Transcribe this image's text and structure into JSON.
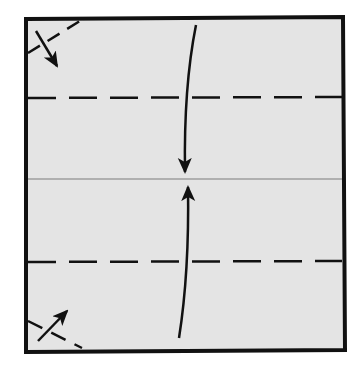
{
  "diagram": {
    "type": "origami-fold-instruction",
    "colors": {
      "background": "#ffffff",
      "paper": "#e4e4e4",
      "outline": "#111111",
      "crease": "#7a7a7a",
      "arrow": "#111111"
    },
    "paper": {
      "x1": 26,
      "y1": 19,
      "x2": 343,
      "y2": 350
    },
    "valley_folds": [
      {
        "name": "top-fold-line",
        "y": 98
      },
      {
        "name": "bottom-fold-line",
        "y": 262
      }
    ],
    "center_crease": {
      "y": 179
    },
    "arrows": [
      {
        "name": "top-fold-arrow",
        "direction": "down"
      },
      {
        "name": "bottom-fold-arrow",
        "direction": "up"
      },
      {
        "name": "top-left-corner-arrow",
        "direction": "down-right"
      },
      {
        "name": "bottom-left-corner-arrow",
        "direction": "up-right"
      }
    ],
    "corner_folds": [
      {
        "name": "top-left-corner-fold"
      },
      {
        "name": "bottom-left-corner-fold"
      }
    ]
  }
}
